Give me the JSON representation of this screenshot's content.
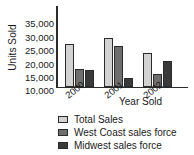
{
  "chart_data": {
    "type": "bar",
    "title": "",
    "xlabel": "Year Sold",
    "ylabel": "Units Sold",
    "categories": [
      "2000",
      "2001",
      "2002"
    ],
    "series": [
      {
        "name": "Total Sales",
        "color": "#d2d2d2",
        "values": [
          23000,
          25000,
          19500
        ]
      },
      {
        "name": "West Coast sales force",
        "color": "#6e6e6e",
        "values": [
          13500,
          22000,
          11500
        ]
      },
      {
        "name": "Midwest sales force",
        "color": "#3a3a3a",
        "values": [
          13000,
          10000,
          16500
        ]
      }
    ],
    "yticks": [
      "10,000",
      "15,000",
      "20,000",
      "25,000",
      "30,000",
      "35,000"
    ],
    "ytick_values": [
      10000,
      15000,
      20000,
      25000,
      30000,
      35000
    ],
    "ylim": [
      7000,
      37000
    ],
    "grid": false,
    "legend_position": "bottom-left"
  }
}
